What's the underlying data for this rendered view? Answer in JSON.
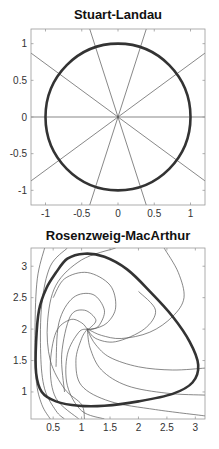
{
  "chart_data": [
    {
      "type": "line",
      "title": "Stuart-Landau",
      "xlabel": "",
      "ylabel": "",
      "xlim": [
        -1.2,
        1.2
      ],
      "ylim": [
        -1.2,
        1.2
      ],
      "grid": false,
      "xticks": [
        -1,
        -0.5,
        0,
        0.5,
        1
      ],
      "xtick_labels": [
        "-1",
        "-0.5",
        "0",
        "0.5",
        "1"
      ],
      "yticks": [
        -1,
        -0.5,
        0,
        0.5,
        1
      ],
      "ytick_labels": [
        "-1",
        "-0.5",
        "0",
        "0.5",
        "1"
      ],
      "series": [
        {
          "name": "limit cycle (unit circle)",
          "style": "thick",
          "shape": "circle",
          "center": [
            0,
            0
          ],
          "radius": 1.0
        },
        {
          "name": "radial trajectories",
          "style": "thin",
          "shape": "lines-through-origin",
          "angles_deg": [
            0,
            36,
            72,
            108,
            144
          ]
        }
      ]
    },
    {
      "type": "line",
      "title": "Rosenzweig-MacArthur",
      "xlabel": "",
      "ylabel": "",
      "xlim": [
        0.11,
        3.17
      ],
      "ylim": [
        0.57,
        3.29
      ],
      "grid": false,
      "xticks": [
        0.5,
        1,
        1.5,
        2,
        2.5,
        3
      ],
      "xtick_labels": [
        "0.5",
        "1",
        "1.5",
        "2",
        "2.5",
        "3"
      ],
      "yticks": [
        1,
        1.5,
        2,
        2.5,
        3
      ],
      "ytick_labels": [
        "1",
        "1.5",
        "2",
        "2.5",
        "3"
      ],
      "equilibrium": [
        1.1,
        2.0
      ],
      "series": [
        {
          "name": "limit cycle",
          "style": "thick",
          "points": [
            [
              0.55,
              2.9
            ],
            [
              0.75,
              3.12
            ],
            [
              1.05,
              3.2
            ],
            [
              1.4,
              3.15
            ],
            [
              1.8,
              2.95
            ],
            [
              2.2,
              2.6
            ],
            [
              2.6,
              2.2
            ],
            [
              2.9,
              1.8
            ],
            [
              3.05,
              1.43
            ],
            [
              2.95,
              1.15
            ],
            [
              2.6,
              0.97
            ],
            [
              2.0,
              0.85
            ],
            [
              1.4,
              0.78
            ],
            [
              0.95,
              0.78
            ],
            [
              0.55,
              0.85
            ],
            [
              0.3,
              1.0
            ],
            [
              0.2,
              1.3
            ],
            [
              0.2,
              1.8
            ],
            [
              0.25,
              2.3
            ],
            [
              0.38,
              2.65
            ],
            [
              0.55,
              2.9
            ]
          ]
        },
        {
          "name": "trajectory 1",
          "style": "thin",
          "points": [
            [
              0.35,
              3.29
            ],
            [
              0.22,
              2.8
            ],
            [
              0.18,
              2.0
            ],
            [
              0.2,
              1.2
            ],
            [
              0.3,
              0.8
            ],
            [
              0.45,
              0.57
            ]
          ]
        },
        {
          "name": "trajectory 2",
          "style": "thin",
          "points": [
            [
              0.75,
              3.29
            ],
            [
              0.45,
              3.0
            ],
            [
              0.3,
              2.4
            ],
            [
              0.28,
              1.6
            ],
            [
              0.35,
              1.05
            ],
            [
              0.55,
              0.7
            ],
            [
              0.7,
              0.57
            ]
          ]
        },
        {
          "name": "trajectory 3",
          "style": "thin",
          "points": [
            [
              1.6,
              3.29
            ],
            [
              1.0,
              3.1
            ],
            [
              0.55,
              2.7
            ],
            [
              0.4,
              2.1
            ],
            [
              0.45,
              1.5
            ],
            [
              0.7,
              1.05
            ],
            [
              1.0,
              0.8
            ],
            [
              1.05,
              0.57
            ]
          ]
        },
        {
          "name": "trajectory 4",
          "style": "thin",
          "points": [
            [
              2.45,
              3.29
            ],
            [
              2.7,
              2.9
            ],
            [
              2.8,
              2.5
            ],
            [
              2.6,
              2.2
            ],
            [
              2.2,
              1.95
            ],
            [
              1.7,
              1.85
            ],
            [
              1.35,
              1.9
            ],
            [
              1.15,
              1.98
            ],
            [
              1.1,
              2.0
            ]
          ]
        },
        {
          "name": "trajectory 5",
          "style": "thin",
          "points": [
            [
              0.5,
              2.5
            ],
            [
              0.7,
              2.8
            ],
            [
              1.1,
              2.9
            ],
            [
              1.5,
              2.7
            ],
            [
              1.6,
              2.35
            ],
            [
              1.45,
              2.1
            ],
            [
              1.2,
              2.0
            ],
            [
              1.1,
              2.0
            ]
          ]
        },
        {
          "name": "trajectory 6",
          "style": "thin",
          "points": [
            [
              0.55,
              1.4
            ],
            [
              0.6,
              2.1
            ],
            [
              0.85,
              2.5
            ],
            [
              1.2,
              2.55
            ],
            [
              1.4,
              2.3
            ],
            [
              1.3,
              2.05
            ],
            [
              1.15,
              2.0
            ],
            [
              1.1,
              2.0
            ]
          ]
        },
        {
          "name": "trajectory 7",
          "style": "thin",
          "points": [
            [
              0.7,
              1.0
            ],
            [
              0.65,
              1.6
            ],
            [
              0.8,
              2.2
            ],
            [
              1.05,
              2.3
            ],
            [
              1.25,
              2.15
            ],
            [
              1.15,
              2.02
            ],
            [
              1.1,
              2.0
            ]
          ]
        },
        {
          "name": "trajectory 8",
          "style": "thin",
          "points": [
            [
              3.17,
              1.38
            ],
            [
              2.6,
              1.35
            ],
            [
              2.0,
              1.4
            ],
            [
              1.5,
              1.55
            ],
            [
              1.25,
              1.75
            ],
            [
              1.12,
              1.95
            ],
            [
              1.1,
              2.0
            ]
          ]
        },
        {
          "name": "trajectory 9",
          "style": "thin",
          "points": [
            [
              3.17,
              0.95
            ],
            [
              2.5,
              0.98
            ],
            [
              1.8,
              1.1
            ],
            [
              1.35,
              1.35
            ],
            [
              1.15,
              1.7
            ],
            [
              1.1,
              2.0
            ]
          ]
        },
        {
          "name": "trajectory 10",
          "style": "thin",
          "points": [
            [
              3.17,
              0.62
            ],
            [
              2.3,
              0.72
            ],
            [
              1.5,
              0.85
            ],
            [
              1.0,
              1.1
            ],
            [
              0.9,
              1.5
            ],
            [
              1.0,
              1.85
            ],
            [
              1.1,
              2.0
            ]
          ]
        },
        {
          "name": "trajectory 11",
          "style": "thin",
          "points": [
            [
              1.4,
              0.57
            ],
            [
              1.0,
              0.7
            ],
            [
              0.75,
              1.1
            ],
            [
              0.75,
              1.6
            ],
            [
              0.95,
              1.95
            ],
            [
              1.1,
              2.0
            ]
          ]
        },
        {
          "name": "trajectory 12",
          "style": "thin",
          "points": [
            [
              2.0,
              2.6
            ],
            [
              2.3,
              2.3
            ],
            [
              2.1,
              2.0
            ],
            [
              1.6,
              1.8
            ],
            [
              1.25,
              1.85
            ],
            [
              1.1,
              2.0
            ]
          ]
        },
        {
          "name": "trajectory 13",
          "style": "thin",
          "points": [
            [
              0.95,
              0.57
            ],
            [
              0.55,
              0.9
            ],
            [
              0.45,
              1.4
            ],
            [
              0.55,
              1.95
            ],
            [
              0.8,
              2.15
            ],
            [
              1.0,
              2.1
            ],
            [
              1.1,
              2.0
            ]
          ]
        }
      ]
    }
  ],
  "layout": {
    "panels": [
      {
        "box": [
          31,
          29,
          205,
          205
        ],
        "title_y": 19
      },
      {
        "box": [
          31,
          248,
          205,
          419
        ],
        "title_y": 240
      }
    ]
  }
}
